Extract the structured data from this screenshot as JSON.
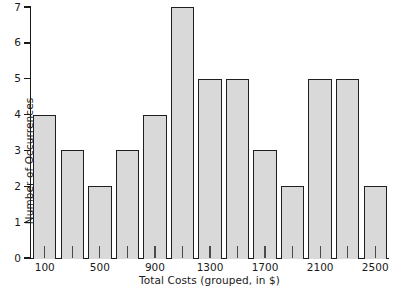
{
  "chart_data": {
    "type": "bar",
    "title": "",
    "xlabel": "Total Costs (grouped, in $)",
    "ylabel": "Number of Occurrences",
    "categories": [
      "100",
      "300",
      "500",
      "700",
      "900",
      "1100",
      "1300",
      "1500",
      "1700",
      "1900",
      "2100",
      "2300",
      "2500"
    ],
    "values": [
      4,
      3,
      2,
      3,
      4,
      7,
      5,
      5,
      3,
      2,
      5,
      5,
      2
    ],
    "xtick_labels": [
      "100",
      "500",
      "900",
      "1300",
      "1700",
      "2100",
      "2500"
    ],
    "xtick_label_indices": [
      0,
      2,
      4,
      6,
      8,
      10,
      12
    ],
    "ytick_labels": [
      "0",
      "1",
      "2",
      "3",
      "4",
      "5",
      "6",
      "7"
    ],
    "ylim": [
      0,
      7
    ],
    "grid": false,
    "legend": false,
    "bar_fill_color": "#d9d9d9",
    "bar_edge_color": "#1f1f1f",
    "axis_color": "#1a1a1a",
    "background_color": "#ffffff"
  }
}
